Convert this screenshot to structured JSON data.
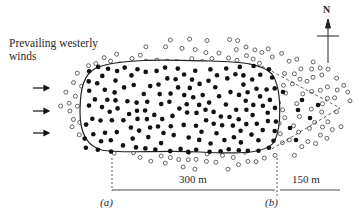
{
  "labels": {
    "wind_line1": "Prevailing westerly",
    "wind_line2": "winds",
    "north": "N",
    "scale_a_b": "300 m",
    "scale_b_end": "150 m",
    "point_a": "(a)",
    "point_b": "(b)"
  },
  "icons": {
    "wind_arrows": [
      "arrow-right-icon",
      "arrow-right-icon",
      "arrow-right-icon"
    ],
    "north_arrow": "north-arrow-icon"
  },
  "legend_semantics": {
    "filled_dots": "dense core (solid outline)",
    "open_circles": "surrounding sparse cloud",
    "dashed_wedge": "downwind extension with scattered filled dots"
  },
  "colors": {
    "ink": "#1a1a1a",
    "open_circle": "#555555",
    "background": "#ffffff"
  },
  "distances": [
    {
      "from": "(a)",
      "to": "(b)",
      "value": "300 m"
    },
    {
      "from": "(b)",
      "to": "east edge",
      "value": "150 m"
    }
  ]
}
